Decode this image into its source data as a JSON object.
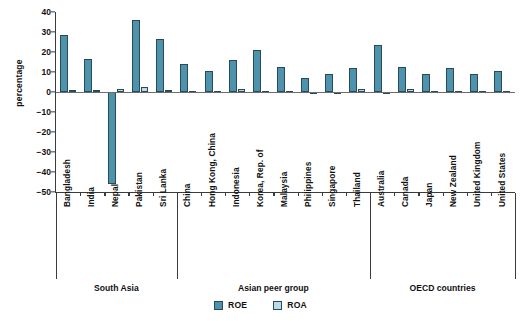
{
  "chart_data": {
    "type": "bar",
    "title": "",
    "xlabel": "",
    "ylabel": "percentage",
    "ylim": [
      -50,
      40
    ],
    "yticks": [
      40,
      30,
      20,
      10,
      0,
      -10,
      -20,
      -30,
      -40,
      -50
    ],
    "grid": false,
    "legend_position": "bottom",
    "categories": [
      "Bangladesh",
      "India",
      "Nepal",
      "Pakistan",
      "Sri Lanka",
      "China",
      "Hong Kong, China",
      "Indonesia",
      "Korea, Rep. of",
      "Malaysia",
      "Philippines",
      "Singapore",
      "Thailand",
      "Australia",
      "Canada",
      "Japan",
      "New Zealand",
      "United Kingdom",
      "United States"
    ],
    "groups": [
      {
        "label": "South Asia",
        "count": 5
      },
      {
        "label": "Asian peer group",
        "count": 8
      },
      {
        "label": "OECD countries",
        "count": 6
      }
    ],
    "series": [
      {
        "name": "ROE",
        "color": "#4e93ad",
        "values": [
          28.5,
          16.5,
          -46.0,
          36.0,
          26.5,
          14.0,
          10.5,
          16.0,
          21.0,
          12.5,
          7.0,
          9.0,
          12.0,
          23.5,
          12.5,
          9.0,
          12.0,
          9.0,
          10.5
        ]
      },
      {
        "name": "ROA",
        "color": "#bcd9e8",
        "values": [
          1.0,
          1.0,
          1.3,
          2.3,
          1.2,
          0.3,
          0.4,
          1.4,
          0.4,
          0.3,
          0.2,
          0.2,
          1.5,
          0.2,
          1.3,
          0.4,
          0.3,
          0.3,
          0.5
        ]
      }
    ]
  },
  "legend": {
    "items": [
      {
        "label": "ROE",
        "key": "roe"
      },
      {
        "label": "ROA",
        "key": "roa"
      }
    ]
  },
  "colors": {
    "roe": "#4e93ad",
    "roa": "#bcd9e8",
    "axis": "#3b3b3b",
    "text": "#111111",
    "background": "#ffffff"
  }
}
